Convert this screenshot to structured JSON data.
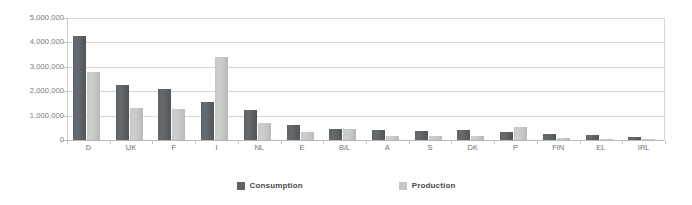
{
  "chart_data": {
    "type": "bar",
    "title": "",
    "xlabel": "",
    "ylabel": "",
    "ylim": [
      0,
      5000000
    ],
    "ytick_values": [
      0,
      1000000,
      2000000,
      3000000,
      4000000,
      5000000
    ],
    "ytick_labels": [
      "0",
      "1,000,000",
      "2,000,000",
      "3,000,000",
      "4,000,000",
      "5,000,000"
    ],
    "grid": true,
    "legend_position": "bottom-center",
    "categories": [
      "D",
      "UK",
      "F",
      "I",
      "NL",
      "E",
      "B/L",
      "A",
      "S",
      "DK",
      "P",
      "FIN",
      "EL",
      "IRL"
    ],
    "series": [
      {
        "name": "Consumption",
        "color": "#5c6266",
        "values": [
          4250000,
          2250000,
          2100000,
          1550000,
          1250000,
          600000,
          450000,
          420000,
          370000,
          430000,
          330000,
          230000,
          190000,
          110000
        ]
      },
      {
        "name": "Production",
        "color": "#c6c8c7",
        "values": [
          2800000,
          1300000,
          1280000,
          3400000,
          700000,
          320000,
          440000,
          150000,
          170000,
          180000,
          520000,
          90000,
          40000,
          30000
        ]
      }
    ]
  },
  "legend": {
    "items": [
      {
        "label": "Consumption",
        "swatch": "consumption"
      },
      {
        "label": "Production",
        "swatch": "production"
      }
    ]
  }
}
